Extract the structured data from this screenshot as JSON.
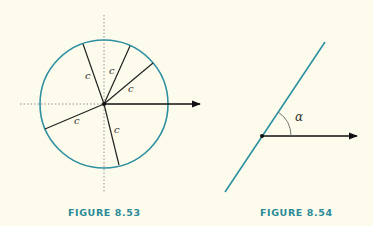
{
  "figures": [
    {
      "caption": "FIGURE 8.53",
      "segment_labels": [
        "c",
        "c",
        "c",
        "c",
        "c"
      ]
    },
    {
      "caption": "FIGURE 8.54",
      "angle_label": "α"
    }
  ],
  "colors": {
    "circle": "#2e8fa0",
    "caption": "#2b8a9a",
    "background": "#fdfcec"
  }
}
